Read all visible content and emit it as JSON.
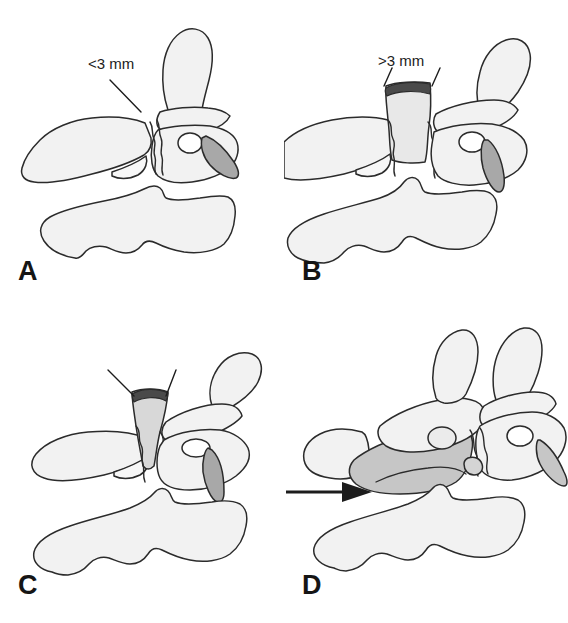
{
  "figure": {
    "type": "medical-illustration",
    "background_color": "#ffffff",
    "stroke_color": "#2b2b2b",
    "fill_light": "#f2f2f2",
    "fill_medium": "#d0d0d0",
    "fill_dark": "#a8a8a8"
  },
  "panels": [
    {
      "id": "A",
      "letter": "A",
      "label": "<3 mm",
      "has_leader_line": true,
      "leader_lines": 1,
      "has_arrow": false,
      "gap_shading": "none",
      "vertebra_count": 2,
      "spinous_process_count": 1
    },
    {
      "id": "B",
      "letter": "B",
      "label": ">3 mm",
      "has_leader_line": true,
      "leader_lines": 2,
      "has_arrow": false,
      "gap_shading": "light-vertical-band",
      "vertebra_count": 2,
      "spinous_process_count": 1
    },
    {
      "id": "C",
      "letter": "C",
      "label": "",
      "has_leader_line": true,
      "leader_lines": 2,
      "has_arrow": false,
      "gap_shading": "wedge",
      "vertebra_count": 2,
      "spinous_process_count": 1
    },
    {
      "id": "D",
      "letter": "D",
      "label": "",
      "has_leader_line": false,
      "leader_lines": 0,
      "has_arrow": true,
      "arrow_direction": "right",
      "gap_shading": "overlap-medium",
      "vertebra_count": 3,
      "spinous_process_count": 2
    }
  ],
  "icons": {
    "arrow": "arrow-right-icon"
  }
}
